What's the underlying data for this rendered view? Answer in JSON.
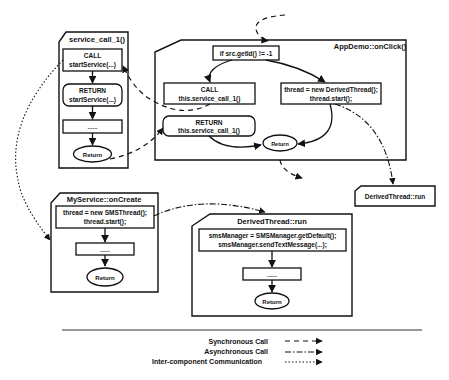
{
  "diagram": {
    "frames": {
      "service_call": {
        "title": "service_call_1()",
        "call_line1": "CALL",
        "call_line2": "startService(...)",
        "return_line1": "RETURN",
        "return_line2": "startService(...)",
        "ellipsis": "......",
        "end": "Return"
      },
      "onclick": {
        "title": "AppDemo::onClick()",
        "condition": "if src.getId() != -1",
        "call_line1": "CALL",
        "call_line2": "this.service_call_1()",
        "thread_line1": "thread = new DerivedThread();",
        "thread_line2": "thread.start();",
        "return_line1": "RETURN",
        "return_line2": "this.service_call_1()",
        "end": "Return"
      },
      "derived_stub": {
        "title": "DerivedThread::run"
      },
      "oncreate": {
        "title": "MyService::onCreate",
        "thread_line1": "thread = new SMSThread();",
        "thread_line2": "thread.start();",
        "ellipsis": "......",
        "end": "Return"
      },
      "derived_run": {
        "title": "DerivedThread::run",
        "sms_line1": "smsManager = SMSManager.getDefault();",
        "sms_line2": "smsManager.sendTextMessage(...);",
        "ellipsis": "......",
        "end": "Return"
      }
    },
    "legend": {
      "items": [
        {
          "label": "Synchronous Call",
          "style": "dashed"
        },
        {
          "label": "Asynchronous Call",
          "style": "dash-dot"
        },
        {
          "label": "Inter-component Communication",
          "style": "dotted"
        }
      ]
    },
    "colors": {
      "stroke": "#111111",
      "background": "#ffffff"
    }
  }
}
